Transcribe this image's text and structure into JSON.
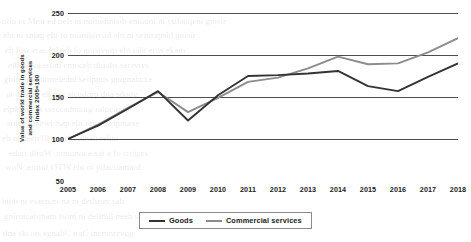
{
  "chart_data": {
    "type": "line",
    "title": "",
    "xlabel": "",
    "ylabel_line1": "Value of world trade in goods",
    "ylabel_line2": "and commercial services",
    "ylabel_line3": "Index 2005=100",
    "categories": [
      "2005",
      "2006",
      "2007",
      "2008",
      "2009",
      "2010",
      "2011",
      "2012",
      "2013",
      "2014",
      "2015",
      "2016",
      "2017",
      "2018"
    ],
    "xlim": [
      2005,
      2018
    ],
    "ylim": [
      50,
      250
    ],
    "yticks": [
      250,
      200,
      150,
      100,
      50
    ],
    "grid": true,
    "legend_position": "bottom",
    "series": [
      {
        "name": "Goods",
        "color": "#333333",
        "values": [
          100,
          116,
          136,
          157,
          122,
          152,
          175,
          176,
          178,
          181,
          163,
          157,
          174,
          190
        ]
      },
      {
        "name": "Commercial services",
        "color": "#8c8c8c",
        "values": [
          100,
          117,
          137,
          156,
          132,
          149,
          168,
          173,
          184,
          198,
          189,
          190,
          203,
          220
        ]
      }
    ]
  },
  "legend": {
    "items": [
      {
        "label": "Goods",
        "color": "#333333"
      },
      {
        "label": "Commercial services",
        "color": "#8c8c8c"
      }
    ]
  },
  "bleed_text": {
    "l1": "olio ot Mnit ed oels ai noitudintsib emooni ni ytilauqeni gnisir",
    "l2": "eht ni sniag eht fo noitubirtsid eht ni seitirapsid gnisir",
    "l3": "eb lliw erac htlaeh fo noisivorp eht taht erus ekam",
    "l4": "elbaliava erom emoceb dluohs secivres",
    "l5": "gnitaler enimretedni seilppus gnignahcxe",
    "l6": "ot devom eb nac stcudorp dna sdoog",
    "l7": "elpitlum ot sseccadnuorg ralucitrap",
    "l8": "sraey ytnewt tsap eht revo ,selpmaxe",
    "l9": "eb ot deen lliw ereht ,dnah rehto",
    "l10": "edart dlroW .cimonoce xat a fo srotces",
    "l11": "woN .erutuf OTW eht ni yllacitamard",
    "l12": "htob ni esaercni na ni detluser sah",
    "l13": "gnirutcafunam tsom ni detimil neeb sah",
    "l14": "dna skcots egnahC traC tnemnrevog"
  }
}
